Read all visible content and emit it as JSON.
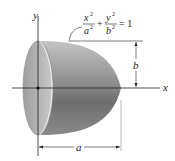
{
  "figure": {
    "axes": {
      "x_label": "x",
      "y_label": "y"
    },
    "equation": {
      "term1_num": "x",
      "term1_num_exp": "2",
      "term1_den": "a",
      "term1_den_exp": "2",
      "plus": "+",
      "term2_num": "y",
      "term2_num_exp": "2",
      "term2_den": "b",
      "term2_den_exp": "2",
      "equals": "= 1"
    },
    "dimensions": {
      "height_label": "b",
      "length_label": "a"
    },
    "colors": {
      "face": "#b9b9b9",
      "body_light": "#bdbdbd",
      "body_dark": "#5a5a5a",
      "lines": "#222222"
    }
  }
}
